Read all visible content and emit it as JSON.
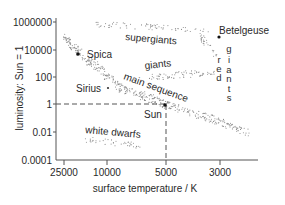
{
  "chart_data": {
    "type": "scatter",
    "xlabel": "surface temperature / K",
    "ylabel": "luminosity: Sun = 1",
    "x_scale": "log, reversed (hot on left)",
    "y_scale": "log",
    "x_ticks": [
      "25000",
      "10000",
      "5000",
      "3000"
    ],
    "y_ticks": [
      "1000000",
      "10000",
      "100",
      "1",
      "0.01",
      "0.0001"
    ],
    "xlim": [
      30000,
      2400
    ],
    "ylim": [
      0.0001,
      1000000
    ],
    "grid": false,
    "regions": [
      {
        "name": "main sequence",
        "description": "diagonal band from hot/bright (upper left) to cool/dim (lower right)"
      },
      {
        "name": "supergiants",
        "description": "horizontal band near top, L ~ 10^5-10^6"
      },
      {
        "name": "giants",
        "description": "band around L ~ 100, T ~ 3000-6000 K"
      },
      {
        "name": "red giants",
        "description": "vertical label near T ~ 3000 K"
      },
      {
        "name": "white dwarfs",
        "description": "low-luminosity band, L ~ 0.001, T ~ 6000-15000 K"
      }
    ],
    "points": [
      {
        "name": "Spica",
        "temperature_K": 22000,
        "luminosity": 12000
      },
      {
        "name": "Sirius",
        "temperature_K": 10000,
        "luminosity": 25
      },
      {
        "name": "Sun",
        "temperature_K": 5000,
        "luminosity": 1
      },
      {
        "name": "Betelgeuse",
        "temperature_K": 3000,
        "luminosity": 60000
      }
    ],
    "annotations": [
      "Sun reference lines: dashed from y=1 and x=5000 to Sun point"
    ]
  },
  "axes": {
    "xlabel": "surface temperature / K",
    "ylabel": "luminosity: Sun = 1",
    "x_ticks": [
      "25000",
      "10000",
      "5000",
      "3000"
    ],
    "y_ticks": [
      "1000000",
      "10000",
      "100",
      "1",
      "0.01",
      "0.0001"
    ]
  },
  "labels": {
    "spica": "Spica",
    "sirius": "Sirius",
    "sun": "Sun",
    "betelgeuse": "Betelgeuse",
    "supergiants": "supergiants",
    "giants": "giants",
    "main_sequence": "main sequence",
    "white_dwarfs": "white dwarfs",
    "red": [
      "r",
      "e",
      "d"
    ],
    "giants_vertical": [
      "g",
      "i",
      "a",
      "n",
      "t",
      "s"
    ]
  }
}
